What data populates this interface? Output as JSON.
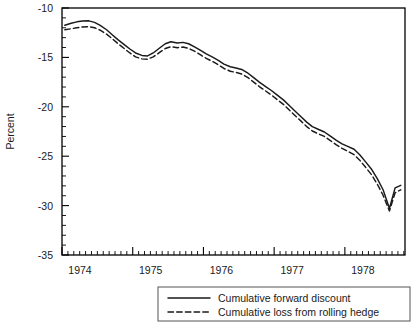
{
  "chart_data": {
    "type": "line",
    "title": "",
    "xlabel": "",
    "ylabel": "Percent",
    "xlim": [
      1974.0,
      1978.85
    ],
    "ylim": [
      -35,
      -10
    ],
    "grid": false,
    "legend_position": "bottom-right-outside",
    "yticks": [
      -10,
      -15,
      -20,
      -25,
      -30,
      -35
    ],
    "ytick_labels": [
      "-10",
      "-15",
      "-20",
      "-25",
      "-30",
      "-35"
    ],
    "ytick_minor_step": 1,
    "xticks": [
      1974,
      1975,
      1976,
      1977,
      1978
    ],
    "xtick_labels": [
      "1974",
      "1975",
      "1976",
      "1977",
      "1978"
    ],
    "xtick_minor_step": 0.08333,
    "x": [
      1974.04,
      1974.13,
      1974.21,
      1974.29,
      1974.38,
      1974.46,
      1974.54,
      1974.63,
      1974.71,
      1974.79,
      1974.88,
      1974.96,
      1975.04,
      1975.13,
      1975.21,
      1975.29,
      1975.38,
      1975.46,
      1975.54,
      1975.63,
      1975.71,
      1975.79,
      1975.88,
      1975.96,
      1976.04,
      1976.13,
      1976.21,
      1976.29,
      1976.38,
      1976.46,
      1976.54,
      1976.63,
      1976.71,
      1976.79,
      1976.88,
      1976.96,
      1977.04,
      1977.13,
      1977.21,
      1977.29,
      1977.38,
      1977.46,
      1977.54,
      1977.63,
      1977.71,
      1977.79,
      1977.88,
      1977.96,
      1978.04,
      1978.13,
      1978.21,
      1978.29,
      1978.38,
      1978.46,
      1978.54,
      1978.63,
      1978.71,
      1978.79
    ],
    "series": [
      {
        "name": "Cumulative forward discount",
        "style": "solid",
        "color": "#1a1a1a",
        "values": [
          -11.75,
          -11.55,
          -11.4,
          -11.32,
          -11.3,
          -11.45,
          -11.75,
          -12.2,
          -12.7,
          -13.2,
          -13.7,
          -14.15,
          -14.55,
          -14.8,
          -14.85,
          -14.55,
          -14.05,
          -13.62,
          -13.42,
          -13.55,
          -13.48,
          -13.62,
          -13.95,
          -14.3,
          -14.65,
          -14.98,
          -15.3,
          -15.68,
          -15.95,
          -16.08,
          -16.22,
          -16.6,
          -17.05,
          -17.5,
          -17.95,
          -18.35,
          -18.8,
          -19.3,
          -19.85,
          -20.4,
          -21.0,
          -21.55,
          -22.0,
          -22.3,
          -22.55,
          -22.95,
          -23.4,
          -23.75,
          -24.0,
          -24.3,
          -24.85,
          -25.55,
          -26.35,
          -27.3,
          -28.4,
          -30.3,
          -28.2,
          -27.95
        ]
      },
      {
        "name": "Cumulative loss from rolling hedge",
        "style": "dashed",
        "color": "#1a1a1a",
        "values": [
          -12.2,
          -12.1,
          -12.0,
          -11.92,
          -11.9,
          -12.0,
          -12.25,
          -12.65,
          -13.1,
          -13.6,
          -14.1,
          -14.55,
          -14.95,
          -15.15,
          -15.18,
          -14.95,
          -14.5,
          -14.1,
          -13.92,
          -14.02,
          -13.95,
          -14.08,
          -14.4,
          -14.75,
          -15.1,
          -15.42,
          -15.75,
          -16.12,
          -16.4,
          -16.52,
          -16.68,
          -17.05,
          -17.5,
          -17.95,
          -18.4,
          -18.8,
          -19.25,
          -19.75,
          -20.3,
          -20.85,
          -21.45,
          -22.0,
          -22.45,
          -22.75,
          -23.0,
          -23.4,
          -23.85,
          -24.2,
          -24.5,
          -24.85,
          -25.4,
          -26.1,
          -26.9,
          -27.85,
          -28.95,
          -30.55,
          -28.7,
          -28.4
        ]
      }
    ]
  },
  "legend": {
    "entries": [
      {
        "label": "Cumulative forward discount",
        "style": "solid"
      },
      {
        "label": "Cumulative loss from rolling hedge",
        "style": "dashed"
      }
    ]
  }
}
